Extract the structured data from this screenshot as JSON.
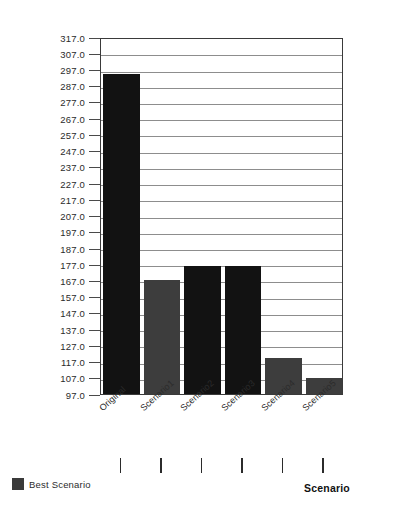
{
  "chart_data": {
    "type": "bar",
    "title": "",
    "subtitle": "",
    "xlabel": "Scenario",
    "ylabel": "",
    "categories": [
      "Original",
      "Scenario1",
      "Scenario2",
      "Scenario3",
      "Scenario4",
      "Scenario5"
    ],
    "values": [
      294.0,
      167.0,
      176.0,
      176.0,
      119.0,
      107.0
    ],
    "series": [
      {
        "name": "Best Scenario",
        "values": [
          294.0,
          167.0,
          176.0,
          176.0,
          119.0,
          107.0
        ]
      }
    ],
    "bar_colors": [
      "#121212",
      "#3d3d3d",
      "#121212",
      "#121212",
      "#3d3d3d",
      "#3d3d3d"
    ],
    "ylim": [
      97.0,
      317.0
    ],
    "ytick_step": 10.0,
    "ytick_labels": [
      "317.0",
      "307.0",
      "297.0",
      "287.0",
      "277.0",
      "267.0",
      "257.0",
      "247.0",
      "237.0",
      "227.0",
      "217.0",
      "207.0",
      "197.0",
      "187.0",
      "177.0",
      "167.0",
      "157.0",
      "147.0",
      "137.0",
      "127.0",
      "117.0",
      "107.0",
      "97.0"
    ],
    "ytick_values": [
      317.0,
      307.0,
      297.0,
      287.0,
      277.0,
      267.0,
      257.0,
      247.0,
      237.0,
      227.0,
      217.0,
      207.0,
      197.0,
      187.0,
      177.0,
      167.0,
      157.0,
      147.0,
      137.0,
      127.0,
      117.0,
      107.0,
      97.0
    ],
    "grid": true,
    "grid_axis": "y",
    "legend": {
      "position": "bottom-left",
      "entries": [
        {
          "label": "Best Scenario",
          "color": "#3a3a3a",
          "marker": "square"
        }
      ]
    },
    "xtick_rotation": -42,
    "plot_background": "#ffffff",
    "frame_color": "#3a3a3a"
  },
  "axis_title": {
    "x": "Scenario"
  }
}
